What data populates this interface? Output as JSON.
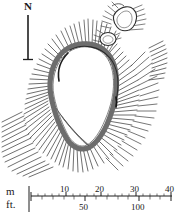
{
  "figure": {
    "type": "archaeological-site-plan",
    "background_color": "#ffffff",
    "ink_color": "#2b2b2b"
  },
  "north_arrow": {
    "label": "N",
    "orientation": "up",
    "x": 28,
    "y_top": 14,
    "y_bottom": 60
  },
  "scale_bar": {
    "metric": {
      "unit_label": "m",
      "ticks": [
        "10",
        "20",
        "30",
        "40"
      ],
      "tick_values": [
        10,
        20,
        30,
        40
      ],
      "tick_x": [
        85,
        113,
        140,
        167
      ],
      "min": 0,
      "max": 40,
      "axis_x_start": 31,
      "axis_x_end": 172,
      "axis_y": 196
    },
    "imperial": {
      "unit_label": "ft.",
      "ticks": [
        "50",
        "100"
      ],
      "tick_values": [
        50,
        100
      ],
      "tick_x": [
        75,
        128
      ],
      "min": 0,
      "max": 130,
      "axis_y": 203
    }
  },
  "features": [
    {
      "name": "main-enclosure",
      "kind": "oval rampart with outward hachures"
    },
    {
      "name": "outlying-enclosure-ne",
      "kind": "small hachured enclosure, north-east"
    },
    {
      "name": "hut-circle",
      "kind": "small ring feature below outlying enclosure"
    },
    {
      "name": "outer-bank-east",
      "kind": "detached hachured bank, east"
    },
    {
      "name": "outer-scarp-sw",
      "kind": "hachured scarp, south-west corner"
    },
    {
      "name": "internal-terrace",
      "kind": "lines forming a wedge at south end of interior"
    }
  ]
}
